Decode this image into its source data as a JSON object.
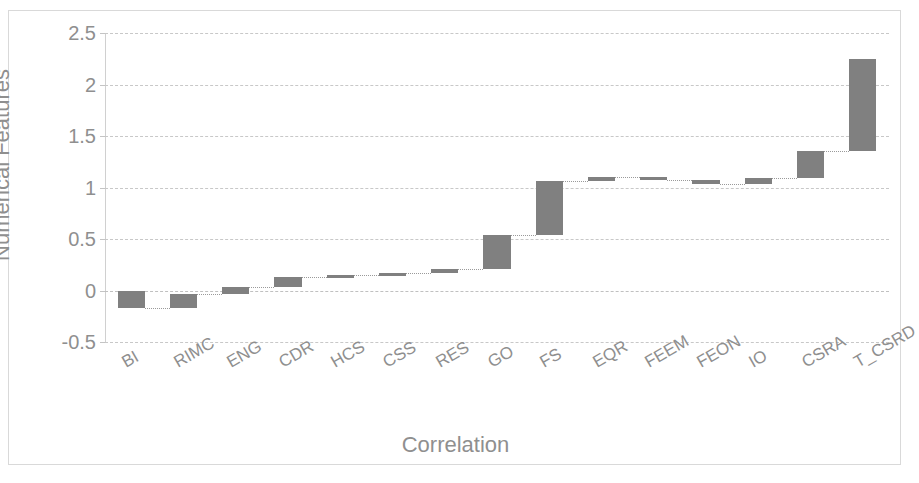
{
  "chart_data": {
    "type": "bar",
    "chart_variant": "waterfall",
    "title": "",
    "xlabel": "Correlation",
    "ylabel": "Numerical Features",
    "ylim": [
      -0.5,
      2.5
    ],
    "ytick_labels": [
      "2.5",
      "2",
      "1.5",
      "1",
      "0.5",
      "0",
      "-0.5"
    ],
    "ytick_values": [
      2.5,
      2,
      1.5,
      1,
      0.5,
      0,
      -0.5
    ],
    "grid": true,
    "grid_style": "dashed",
    "legend": "none",
    "bar_color": "#808080",
    "axis_text_color": "#8f8f8f",
    "categories": [
      "BI",
      "RIMC",
      "ENG",
      "CDR",
      "HCS",
      "CSS",
      "RES",
      "GO",
      "FS",
      "EQR",
      "FEEM",
      "FEON",
      "IO",
      "CSRA",
      "T_CSRD"
    ],
    "bar_start": [
      0,
      -0.17,
      -0.03,
      0.03,
      0.13,
      0.15,
      0.17,
      0.21,
      0.54,
      1.06,
      1.1,
      1.07,
      1.03,
      1.09,
      1.35
    ],
    "bar_end": [
      -0.17,
      -0.03,
      0.03,
      0.13,
      0.15,
      0.17,
      0.21,
      0.54,
      1.06,
      1.1,
      1.07,
      1.03,
      1.09,
      1.35,
      2.25
    ],
    "values": [
      -0.17,
      0.14,
      0.06,
      0.1,
      0.02,
      0.02,
      0.04,
      0.33,
      0.52,
      0.04,
      -0.03,
      -0.04,
      0.06,
      0.26,
      0.9
    ],
    "cumulative": [
      -0.17,
      -0.03,
      0.03,
      0.13,
      0.15,
      0.17,
      0.21,
      0.54,
      1.06,
      1.1,
      1.07,
      1.03,
      1.09,
      1.35,
      2.25
    ]
  }
}
